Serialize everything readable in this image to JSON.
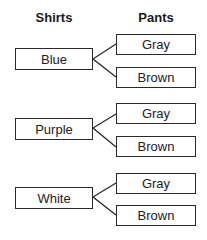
{
  "headers": {
    "shirts": "Shirts",
    "pants": "Pants"
  },
  "groups": [
    {
      "shirt": "Blue",
      "pants": [
        "Gray",
        "Brown"
      ]
    },
    {
      "shirt": "Purple",
      "pants": [
        "Gray",
        "Brown"
      ]
    },
    {
      "shirt": "White",
      "pants": [
        "Gray",
        "Brown"
      ]
    }
  ],
  "colors": {
    "line": "#2a2a2a",
    "text": "#222222",
    "background": "#ffffff"
  }
}
